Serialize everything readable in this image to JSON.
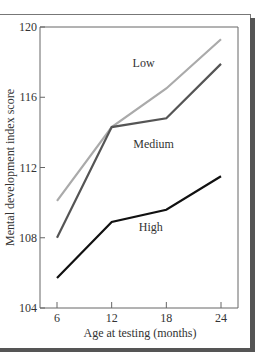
{
  "chart_data": {
    "type": "line",
    "title": "",
    "xlabel": "Age at testing (months)",
    "ylabel": "Mental development index score",
    "x": [
      6,
      12,
      18,
      24
    ],
    "xticks": [
      "6",
      "12",
      "18",
      "24"
    ],
    "yticks": [
      "104",
      "108",
      "112",
      "116",
      "120"
    ],
    "ylim": [
      104,
      120
    ],
    "grid": false,
    "legend_position": "inline labels",
    "series": [
      {
        "name": "Low",
        "values": [
          110.1,
          114.3,
          116.5,
          119.3
        ],
        "color": "#aaaaaa"
      },
      {
        "name": "Medium",
        "values": [
          108.0,
          114.3,
          114.8,
          117.9
        ],
        "color": "#555555"
      },
      {
        "name": "High",
        "values": [
          105.7,
          108.9,
          109.6,
          111.5
        ],
        "color": "#111111"
      }
    ],
    "annotations": [
      {
        "text": "Low",
        "x": 15.5,
        "y": 117.7
      },
      {
        "text": "Medium",
        "x": 16.6,
        "y": 113.1
      },
      {
        "text": "High",
        "x": 16.3,
        "y": 108.4
      }
    ]
  }
}
